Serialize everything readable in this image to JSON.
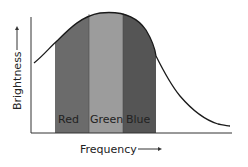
{
  "diagram": {
    "type": "spectrum-bands",
    "x_axis_label": "Frequency",
    "y_axis_label": "Brightness",
    "bands": [
      {
        "label": "Red",
        "color": "#6b6b6b"
      },
      {
        "label": "Green",
        "color": "#9c9c9c"
      },
      {
        "label": "Blue",
        "color": "#555555"
      }
    ],
    "curve": "bell-shaped brightness distribution peaking over the Green band",
    "colors": {
      "curve": "#1a1a1a",
      "axes": "#333333",
      "background": "#ffffff"
    }
  }
}
